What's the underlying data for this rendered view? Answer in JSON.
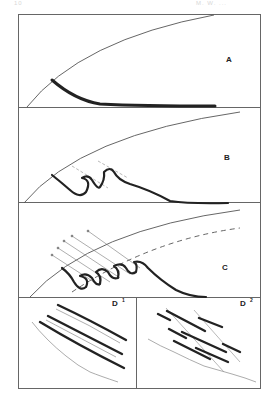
{
  "page_header": {
    "left": "10",
    "right": "M. W. ..."
  },
  "figure": {
    "panels": [
      {
        "id": "A",
        "label": "A",
        "description": "Straight/curved dark layer trailing from surface"
      },
      {
        "id": "B",
        "label": "B",
        "description": "Layer deformed into folds with dashed axial traces"
      },
      {
        "id": "C",
        "label": "C",
        "description": "Tight recumbent folds with arrows and dashed shear line"
      },
      {
        "id": "D1",
        "label": "D",
        "superscript": "1",
        "description": "Parallel dark layers above wavy base"
      },
      {
        "id": "D2",
        "label": "D",
        "superscript": "2",
        "description": "Offset dark layer segments cut by faults above wavy base"
      }
    ]
  },
  "colors": {
    "ink": "#222222",
    "thin_line": "#555555",
    "light_line": "#999999",
    "frame": "#666666"
  }
}
